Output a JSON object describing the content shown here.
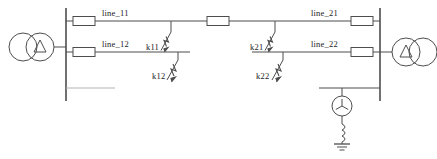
{
  "diagram": {
    "type": "single-line-electrical-diagram",
    "background_color": "#ffffff",
    "line_color": "#4d4d4d",
    "text_color": "#1a1a1a"
  },
  "labels": {
    "line_11": "line_11",
    "line_12": "line_12",
    "line_21": "line_21",
    "line_22": "line_22",
    "k11": "k11",
    "k12": "k12",
    "k21": "k21",
    "k22": "k22"
  },
  "components": {
    "transformer_left": {
      "name": "left-transformer",
      "winding_left_symbol": "circle",
      "winding_right_symbol": "delta"
    },
    "transformer_right": {
      "name": "right-transformer",
      "winding_left_symbol": "delta",
      "winding_right_symbol": "circle"
    },
    "bus_left": {
      "name": "left-busbar"
    },
    "bus_right": {
      "name": "right-busbar"
    },
    "generator": {
      "name": "generator",
      "symbol": "three-phase-source",
      "reactor": "coil",
      "earth": "ground"
    },
    "breakers": [
      {
        "name": "breaker-line-11-left"
      },
      {
        "name": "breaker-line-12-left"
      },
      {
        "name": "breaker-line-mid"
      },
      {
        "name": "breaker-line-21-right"
      },
      {
        "name": "breaker-line-22-right"
      }
    ],
    "faults": [
      {
        "name": "fault-k11",
        "label_key": "k11"
      },
      {
        "name": "fault-k12",
        "label_key": "k12"
      },
      {
        "name": "fault-k21",
        "label_key": "k21"
      },
      {
        "name": "fault-k22",
        "label_key": "k22"
      }
    ]
  }
}
